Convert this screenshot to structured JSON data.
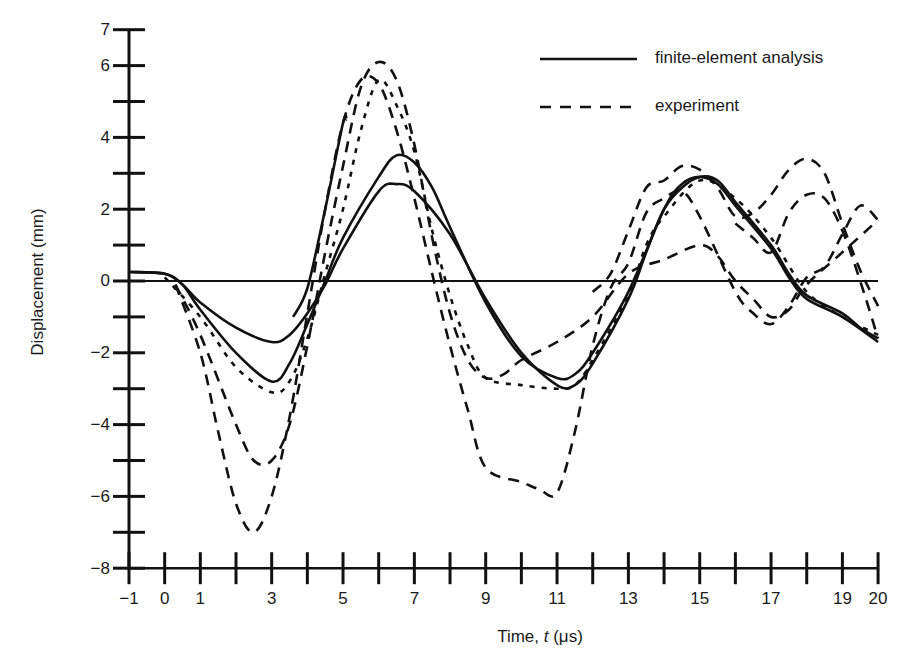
{
  "chart_data": {
    "type": "line",
    "title": "",
    "xlabel": "Time, t (μs)",
    "ylabel": "Displacement (mm)",
    "xlim": [
      -1,
      20
    ],
    "ylim": [
      -8,
      7
    ],
    "grid": false,
    "legend_position": "top-right",
    "x_ticks": [
      -1,
      0,
      1,
      2,
      3,
      4,
      5,
      6,
      7,
      8,
      9,
      10,
      11,
      12,
      13,
      14,
      15,
      16,
      17,
      18,
      19,
      20
    ],
    "x_tick_labels": [
      {
        "value": -1,
        "label": "−1"
      },
      {
        "value": 0,
        "label": "0"
      },
      {
        "value": 1,
        "label": "1"
      },
      {
        "value": 3,
        "label": "3"
      },
      {
        "value": 5,
        "label": "5"
      },
      {
        "value": 7,
        "label": "7"
      },
      {
        "value": 9,
        "label": "9"
      },
      {
        "value": 11,
        "label": "11"
      },
      {
        "value": 13,
        "label": "13"
      },
      {
        "value": 15,
        "label": "15"
      },
      {
        "value": 17,
        "label": "17"
      },
      {
        "value": 19,
        "label": "19"
      },
      {
        "value": 20,
        "label": "20"
      }
    ],
    "y_ticks": [
      7,
      6,
      5,
      4,
      3,
      2,
      1,
      0,
      -1,
      -2,
      -3,
      -4,
      -5,
      -6,
      -7,
      -8
    ],
    "y_tick_labels": [
      {
        "value": 7,
        "label": "7"
      },
      {
        "value": 6,
        "label": "6"
      },
      {
        "value": 4,
        "label": "4"
      },
      {
        "value": 2,
        "label": "2"
      },
      {
        "value": 0,
        "label": "0"
      },
      {
        "value": -2,
        "label": "−2"
      },
      {
        "value": -4,
        "label": "−4"
      },
      {
        "value": -6,
        "label": "−6"
      },
      {
        "value": -8,
        "label": "−8"
      }
    ],
    "zero_line": true,
    "legend": [
      {
        "label": "finite-element analysis",
        "style": "solid"
      },
      {
        "label": "experiment",
        "style": "dashed"
      }
    ],
    "series": [
      {
        "name": "finite-element analysis (1)",
        "style": "solid",
        "points": [
          [
            -1,
            0.25
          ],
          [
            0,
            0.2
          ],
          [
            0.5,
            -0.1
          ],
          [
            1,
            -0.6
          ],
          [
            2,
            -1.3
          ],
          [
            3,
            -1.7
          ],
          [
            3.5,
            -1.5
          ],
          [
            4,
            -0.9
          ],
          [
            4.5,
            -0.1
          ],
          [
            5,
            0.9
          ],
          [
            6,
            2.5
          ],
          [
            6.5,
            2.7
          ],
          [
            7,
            2.5
          ],
          [
            8,
            1.3
          ],
          [
            9,
            -0.5
          ],
          [
            10,
            -2.0
          ],
          [
            11,
            -2.9
          ],
          [
            11.5,
            -2.9
          ],
          [
            12,
            -2.3
          ],
          [
            13,
            -0.5
          ],
          [
            13.5,
            0.8
          ],
          [
            14,
            2.0
          ],
          [
            14.5,
            2.6
          ],
          [
            15,
            2.9
          ],
          [
            15.5,
            2.8
          ],
          [
            16,
            2.2
          ],
          [
            17,
            1.0
          ],
          [
            17.5,
            0.2
          ],
          [
            18,
            -0.4
          ],
          [
            19,
            -0.9
          ],
          [
            19.5,
            -1.3
          ],
          [
            20,
            -1.6
          ]
        ]
      },
      {
        "name": "finite-element analysis (2)",
        "style": "solid",
        "points": [
          [
            -1,
            0.25
          ],
          [
            0,
            0.2
          ],
          [
            0.5,
            -0.1
          ],
          [
            1,
            -0.8
          ],
          [
            2,
            -2.0
          ],
          [
            3,
            -2.8
          ],
          [
            3.5,
            -2.3
          ],
          [
            4,
            -1.2
          ],
          [
            4.5,
            0.0
          ],
          [
            5,
            1.2
          ],
          [
            6,
            2.9
          ],
          [
            6.5,
            3.5
          ],
          [
            7,
            3.3
          ],
          [
            7.5,
            2.6
          ],
          [
            8,
            1.5
          ],
          [
            9,
            -0.6
          ],
          [
            10,
            -2.1
          ],
          [
            11,
            -2.7
          ],
          [
            11.5,
            -2.6
          ],
          [
            12,
            -2.0
          ],
          [
            13,
            -0.3
          ],
          [
            14,
            2.0
          ],
          [
            14.5,
            2.7
          ],
          [
            15,
            2.9
          ],
          [
            15.5,
            2.7
          ],
          [
            16,
            2.1
          ],
          [
            17,
            0.9
          ],
          [
            17.5,
            0.1
          ],
          [
            18,
            -0.5
          ],
          [
            19,
            -1.0
          ],
          [
            20,
            -1.7
          ]
        ]
      },
      {
        "name": "finite-element analysis (3, partial rise)",
        "style": "solid",
        "points": [
          [
            3.6,
            -1.0
          ],
          [
            4,
            -0.2
          ],
          [
            4.5,
            2.0
          ],
          [
            5,
            4.4
          ],
          [
            5.1,
            4.5
          ]
        ]
      },
      {
        "name": "experiment (1)",
        "style": "dotted",
        "points": [
          [
            0,
            0.1
          ],
          [
            1,
            -1.0
          ],
          [
            2,
            -2.4
          ],
          [
            3,
            -3.1
          ],
          [
            3.5,
            -2.8
          ],
          [
            4,
            -1.6
          ],
          [
            4.5,
            0.2
          ],
          [
            5,
            2.0
          ],
          [
            5.5,
            4.2
          ],
          [
            6,
            5.6
          ],
          [
            6.5,
            4.9
          ],
          [
            7,
            3.6
          ],
          [
            7.5,
            1.4
          ],
          [
            8,
            -0.4
          ],
          [
            8.5,
            -1.8
          ],
          [
            9,
            -2.7
          ],
          [
            10,
            -2.9
          ],
          [
            11,
            -3.0
          ],
          [
            11.5,
            -2.9
          ],
          [
            12,
            -2.2
          ],
          [
            13,
            -0.4
          ],
          [
            13.5,
            1.0
          ],
          [
            14,
            1.8
          ],
          [
            15,
            2.8
          ],
          [
            16,
            2.3
          ],
          [
            17,
            1.2
          ],
          [
            18,
            -0.3
          ],
          [
            19,
            -1.0
          ],
          [
            20,
            -1.5
          ]
        ]
      },
      {
        "name": "experiment (2)",
        "style": "dashed",
        "points": [
          [
            0.3,
            -0.1
          ],
          [
            1,
            -1.5
          ],
          [
            2,
            -4.0
          ],
          [
            2.5,
            -5.0
          ],
          [
            3,
            -5.0
          ],
          [
            3.5,
            -4.0
          ],
          [
            4,
            -1.8
          ],
          [
            4.5,
            0.8
          ],
          [
            5,
            3.2
          ],
          [
            5.5,
            5.4
          ],
          [
            6,
            6.1
          ],
          [
            6.5,
            5.6
          ],
          [
            7,
            3.8
          ],
          [
            7.5,
            1.2
          ],
          [
            8,
            -0.9
          ],
          [
            8.5,
            -2.2
          ],
          [
            9,
            -2.7
          ],
          [
            9.5,
            -2.6
          ],
          [
            10,
            -2.2
          ],
          [
            11,
            -1.7
          ],
          [
            12,
            -1.0
          ],
          [
            13,
            0.2
          ],
          [
            14,
            0.6
          ],
          [
            15,
            1.0
          ],
          [
            15.5,
            0.7
          ],
          [
            16,
            0.0
          ],
          [
            16.5,
            -0.5
          ],
          [
            17,
            -1.0
          ],
          [
            17.5,
            -0.8
          ],
          [
            18,
            -0.1
          ],
          [
            19,
            0.8
          ],
          [
            20,
            1.7
          ]
        ]
      },
      {
        "name": "experiment (3)",
        "style": "dashed",
        "points": [
          [
            0.3,
            -0.1
          ],
          [
            1,
            -2.0
          ],
          [
            1.5,
            -4.2
          ],
          [
            2,
            -6.2
          ],
          [
            2.5,
            -7.0
          ],
          [
            3,
            -6.0
          ],
          [
            3.5,
            -3.8
          ],
          [
            4,
            -0.9
          ],
          [
            4.5,
            2.0
          ],
          [
            5,
            4.4
          ],
          [
            5.5,
            5.6
          ],
          [
            6,
            5.5
          ],
          [
            6.5,
            4.2
          ],
          [
            7,
            2.3
          ],
          [
            7.5,
            0.2
          ],
          [
            8,
            -1.8
          ],
          [
            8.5,
            -3.6
          ],
          [
            9,
            -5.2
          ],
          [
            10,
            -5.6
          ],
          [
            10.5,
            -5.8
          ],
          [
            11,
            -5.9
          ],
          [
            11.5,
            -4.2
          ],
          [
            12,
            -1.8
          ],
          [
            12.5,
            -0.2
          ],
          [
            13,
            0.5
          ],
          [
            13.5,
            1.9
          ],
          [
            14,
            2.3
          ],
          [
            14.5,
            2.5
          ],
          [
            15,
            1.8
          ],
          [
            16,
            -0.3
          ],
          [
            16.5,
            -0.9
          ],
          [
            17,
            -1.2
          ],
          [
            17.5,
            -0.7
          ],
          [
            18,
            0.1
          ],
          [
            18.5,
            0.4
          ],
          [
            19,
            1.3
          ],
          [
            19.5,
            2.1
          ],
          [
            20,
            1.7
          ]
        ]
      },
      {
        "name": "experiment (4)",
        "style": "dashed",
        "points": [
          [
            12,
            -0.3
          ],
          [
            12.5,
            0.2
          ],
          [
            13,
            1.4
          ],
          [
            13.5,
            2.6
          ],
          [
            14,
            2.8
          ],
          [
            14.5,
            3.2
          ],
          [
            15,
            3.1
          ],
          [
            15.5,
            2.6
          ],
          [
            16,
            1.8
          ],
          [
            16.5,
            1.9
          ],
          [
            17,
            2.4
          ],
          [
            17.5,
            3.1
          ],
          [
            18,
            3.4
          ],
          [
            18.5,
            3.0
          ],
          [
            19,
            1.6
          ],
          [
            19.5,
            0.3
          ],
          [
            20,
            -0.7
          ]
        ]
      },
      {
        "name": "experiment (5)",
        "style": "dashed",
        "points": [
          [
            16,
            1.6
          ],
          [
            16.5,
            1.2
          ],
          [
            17,
            0.8
          ],
          [
            17.5,
            1.9
          ],
          [
            18,
            2.4
          ],
          [
            18.5,
            2.3
          ],
          [
            19,
            1.4
          ],
          [
            19.5,
            0.0
          ],
          [
            20,
            -1.6
          ]
        ]
      }
    ]
  },
  "legend": {
    "items": [
      {
        "label": "finite-element analysis"
      },
      {
        "label": "experiment"
      }
    ]
  },
  "axes": {
    "x_title": "Time, t (μs)",
    "y_title": "Displacement (mm)"
  }
}
